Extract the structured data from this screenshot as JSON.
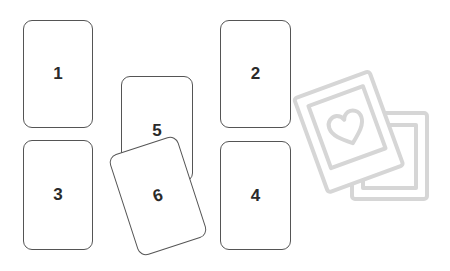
{
  "cards": [
    {
      "id": 1,
      "label": "1"
    },
    {
      "id": 2,
      "label": "2"
    },
    {
      "id": 3,
      "label": "3"
    },
    {
      "id": 4,
      "label": "4"
    },
    {
      "id": 5,
      "label": "5"
    },
    {
      "id": 6,
      "label": "6"
    }
  ],
  "decoration": {
    "icon": "photo-cards-heart-icon",
    "color": "#d6d6d6"
  }
}
